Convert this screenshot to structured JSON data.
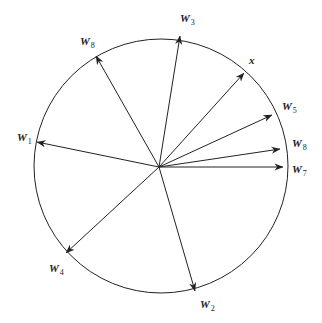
{
  "diagram": {
    "type": "vector-circle",
    "circle": {
      "cx": 161,
      "cy": 166,
      "r": 127,
      "stroke": "#222222"
    },
    "origin": {
      "x": 159,
      "y": 167
    },
    "vectors": [
      {
        "id": "W1",
        "base": "W",
        "sub": "1",
        "tip": [
          37,
          142
        ],
        "label_pos": [
          17,
          141
        ]
      },
      {
        "id": "W8a",
        "base": "W",
        "sub": "8",
        "tip": [
          96,
          56
        ],
        "label_pos": [
          80,
          45
        ]
      },
      {
        "id": "W3",
        "base": "W",
        "sub": "3",
        "tip": [
          180,
          36
        ],
        "label_pos": [
          180,
          22
        ]
      },
      {
        "id": "x",
        "base": "x",
        "sub": "",
        "tip": [
          244,
          73
        ],
        "label_pos": [
          249,
          64
        ]
      },
      {
        "id": "W5",
        "base": "W",
        "sub": "5",
        "tip": [
          272,
          115
        ],
        "label_pos": [
          282,
          110
        ]
      },
      {
        "id": "W8b",
        "base": "W",
        "sub": "8",
        "tip": [
          280,
          149
        ],
        "label_pos": [
          292,
          147
        ]
      },
      {
        "id": "W7",
        "base": "W",
        "sub": "7",
        "tip": [
          283,
          167
        ],
        "label_pos": [
          292,
          173
        ]
      },
      {
        "id": "W4",
        "base": "W",
        "sub": "4",
        "tip": [
          66,
          253
        ],
        "label_pos": [
          49,
          272
        ]
      },
      {
        "id": "W2",
        "base": "W",
        "sub": "2",
        "tip": [
          195,
          291
        ],
        "label_pos": [
          200,
          308
        ]
      }
    ]
  }
}
